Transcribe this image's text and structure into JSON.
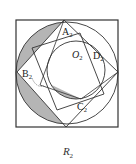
{
  "figure": {
    "caption": "R",
    "caption_sub": "2",
    "labels": [
      {
        "id": "A",
        "text": "A",
        "sub": "2"
      },
      {
        "id": "B",
        "text": "B",
        "sub": "2"
      },
      {
        "id": "C",
        "text": "C",
        "sub": "2"
      },
      {
        "id": "D",
        "text": "D",
        "sub": "2"
      },
      {
        "id": "O",
        "text": "O",
        "sub": "2"
      }
    ],
    "colors": {
      "line": "#333333",
      "shade": "#b5b5b5",
      "background": "#ffffff"
    }
  }
}
